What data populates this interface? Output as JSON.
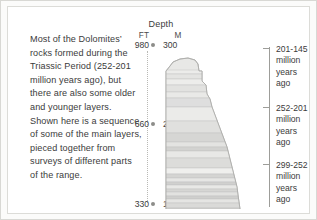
{
  "blurb": {
    "text": "Most of the Dolomites’ rocks formed during the Triassic Period (252-201 million years ago), but there are also some older and younger layers. Shown here is a sequence of some of the main layers, pieced together from surveys of different parts of the range."
  },
  "depth_scale": {
    "title": "Depth",
    "unit_ft": "FT",
    "unit_m": "M",
    "ticks": [
      {
        "ft": "980",
        "m": "300",
        "y": 38
      },
      {
        "ft": "660",
        "m": "200",
        "y": 117
      },
      {
        "ft": "330",
        "m": "100",
        "y": 197
      }
    ]
  },
  "age_axis": {
    "entries": [
      {
        "range": "201-145",
        "l2": "million",
        "l3": "years",
        "l4": "ago",
        "tick_y": 41,
        "box_y": 37
      },
      {
        "range": "252-201",
        "l2": "million",
        "l3": "years",
        "l4": "ago",
        "tick_y": 100,
        "box_y": 96
      },
      {
        "range": "299-252",
        "l2": "million",
        "l3": "years",
        "l4": "ago",
        "tick_y": 157,
        "box_y": 153
      }
    ],
    "bracket_top": 40,
    "bracket_bottom": 200
  },
  "chart_data": {
    "type": "area",
    "title": "Depth",
    "ylabel": "Depth",
    "y_units": [
      "FT",
      "M"
    ],
    "y_ticks_ft": [
      980,
      660,
      330
    ],
    "y_ticks_m": [
      300,
      200,
      100
    ],
    "ylim_m": [
      100,
      300
    ],
    "right_axis_label": "age of layers",
    "age_bands": [
      "201-145 million years ago",
      "252-201 million years ago",
      "299-252 million years ago"
    ],
    "strata": [
      {
        "y": 33,
        "h": 4,
        "tone": "#ececea"
      },
      {
        "y": 37,
        "h": 5,
        "tone": "#e4e4e2"
      },
      {
        "y": 42,
        "h": 6,
        "tone": "#ededeb"
      },
      {
        "y": 48,
        "h": 7,
        "tone": "#e2e2e0"
      },
      {
        "y": 55,
        "h": 6,
        "tone": "#e9e9e7"
      },
      {
        "y": 61,
        "h": 9,
        "tone": "#dedede"
      },
      {
        "y": 70,
        "h": 14,
        "tone": "#ebebe9"
      },
      {
        "y": 84,
        "h": 12,
        "tone": "#e0e0de"
      },
      {
        "y": 96,
        "h": 9,
        "tone": "#d6d6d4"
      },
      {
        "y": 105,
        "h": 5,
        "tone": "#e3e3e1"
      },
      {
        "y": 110,
        "h": 4,
        "tone": "#d2d2d0"
      },
      {
        "y": 114,
        "h": 7,
        "tone": "#e8e8e6"
      },
      {
        "y": 121,
        "h": 10,
        "tone": "#dcdcda"
      },
      {
        "y": 131,
        "h": 6,
        "tone": "#efefed"
      },
      {
        "y": 137,
        "h": 4,
        "tone": "#d4d4d2"
      },
      {
        "y": 141,
        "h": 4,
        "tone": "#e6e6e4"
      },
      {
        "y": 145,
        "h": 3,
        "tone": "#d0d0ce"
      },
      {
        "y": 148,
        "h": 4,
        "tone": "#e8e8e6"
      },
      {
        "y": 152,
        "h": 3,
        "tone": "#d6d6d4"
      },
      {
        "y": 155,
        "h": 4,
        "tone": "#e2e2e0"
      },
      {
        "y": 159,
        "h": 3,
        "tone": "#cfcfcd"
      },
      {
        "y": 162,
        "h": 4,
        "tone": "#e5e5e3"
      },
      {
        "y": 166,
        "h": 5,
        "tone": "#dadad8"
      },
      {
        "y": 171,
        "h": 5,
        "tone": "#ededeb"
      }
    ]
  }
}
